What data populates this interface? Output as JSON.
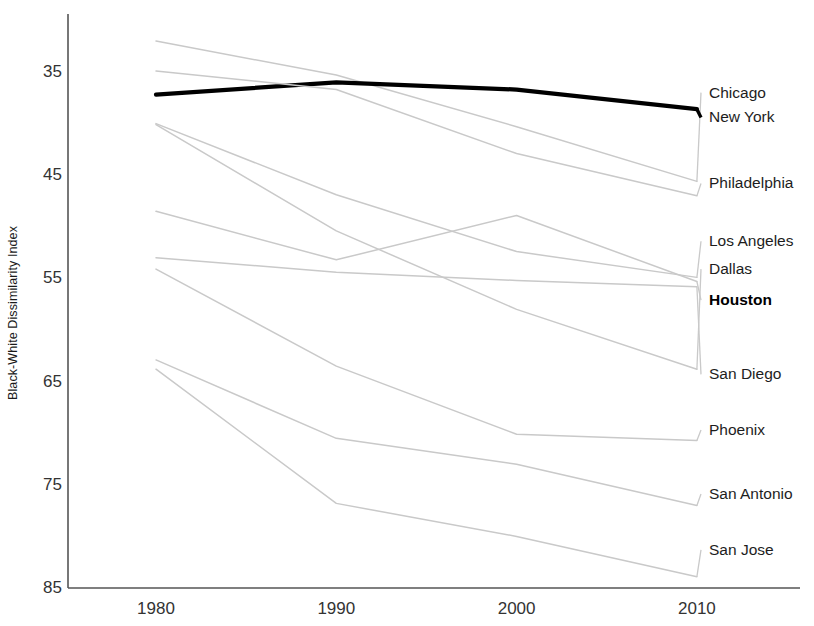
{
  "axes": {
    "ylabel": "Black-White Dissimilarity Index",
    "yticks": [
      "85",
      "75",
      "65",
      "55",
      "45",
      "35"
    ],
    "xticks": [
      "1980",
      "1990",
      "2000",
      "2010"
    ]
  },
  "colors": {
    "highlight": "#000000",
    "other": "#c9c9c9",
    "axis": "#555555",
    "text": "#1d1d1d"
  },
  "labels": {
    "chicago": "Chicago",
    "new_york": "New York",
    "philadelphia": "Philadelphia",
    "los_angeles": "Los Angeles",
    "dallas": "Dallas",
    "houston": "Houston",
    "san_diego": "San Diego",
    "phoenix": "Phoenix",
    "san_antonio": "San Antonio",
    "san_jose": "San Jose"
  },
  "chart_data": {
    "type": "line",
    "title": "",
    "xlabel": "",
    "ylabel": "Black-White Dissimilarity Index",
    "x": [
      1980,
      1990,
      2000,
      2010
    ],
    "xlim": [
      1976,
      2014
    ],
    "ylim": [
      35,
      89
    ],
    "yticks": [
      35,
      45,
      55,
      65,
      75,
      85
    ],
    "grid": false,
    "legend": "right-inline-labels",
    "highlight_series": "Houston",
    "series": [
      {
        "name": "Chicago",
        "values": [
          88.0,
          84.7,
          79.7,
          74.4
        ],
        "color": "#c9c9c9",
        "label_y": 83.0
      },
      {
        "name": "New York",
        "values": [
          82.8,
          84.0,
          83.3,
          81.4
        ],
        "color": "#000000",
        "label_y": 80.6,
        "highlight": true
      },
      {
        "name": "Philadelphia",
        "values": [
          85.1,
          83.3,
          77.1,
          73.0
        ],
        "color": "#c9c9c9",
        "label_y": 74.2
      },
      {
        "name": "Los Angeles",
        "values": [
          80.0,
          73.1,
          67.6,
          65.1
        ],
        "color": "#c9c9c9",
        "label_y": 68.6
      },
      {
        "name": "Dallas",
        "values": [
          79.9,
          69.6,
          62.0,
          56.2
        ],
        "color": "#c9c9c9",
        "label_y": 65.9
      },
      {
        "name": "Houston",
        "values": [
          71.5,
          66.8,
          71.1,
          64.7
        ],
        "color": "#c9c9c9",
        "label_y": 62.9,
        "bold_label": true
      },
      {
        "name": "San Diego",
        "values": [
          67.0,
          65.6,
          64.8,
          64.2
        ],
        "color": "#c9c9c9",
        "label_y": 55.7
      },
      {
        "name": "Phoenix",
        "values": [
          65.9,
          56.5,
          49.9,
          49.3
        ],
        "color": "#c9c9c9",
        "label_y": 50.3
      },
      {
        "name": "San Antonio",
        "values": [
          57.1,
          49.5,
          47.0,
          43.0
        ],
        "color": "#c9c9c9",
        "label_y": 44.1
      },
      {
        "name": "San Jose",
        "values": [
          56.2,
          43.2,
          40.0,
          36.1
        ],
        "color": "#c9c9c9",
        "label_y": 38.7
      }
    ]
  }
}
